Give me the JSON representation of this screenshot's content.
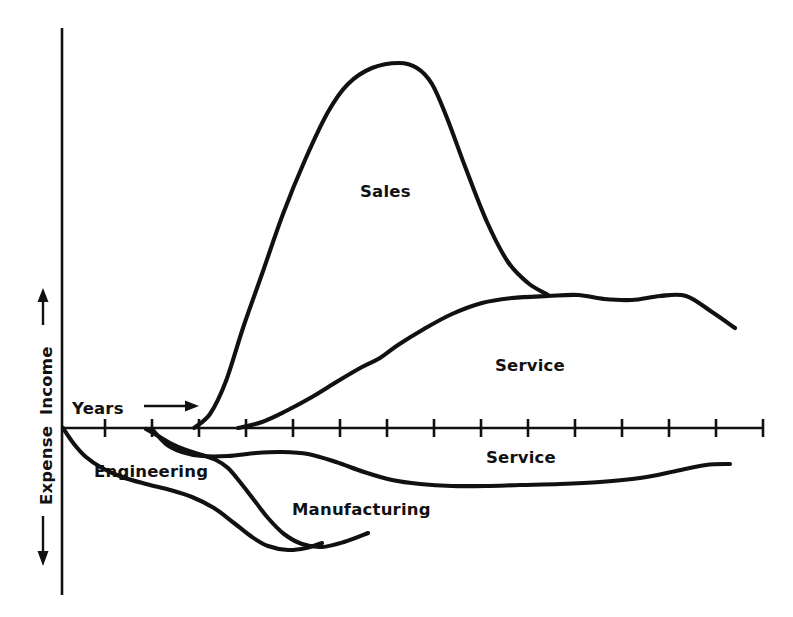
{
  "figure": {
    "background_color": "#ffffff",
    "ink_color": "#111111",
    "width": 793,
    "height": 617
  },
  "axes": {
    "y_axis_name": "income-expense-axis",
    "x_axis_name": "years-axis",
    "origin_px": {
      "x": 62,
      "y": 428
    },
    "x_axis_end_px": {
      "x": 763,
      "y": 428
    },
    "y_axis_top_px": {
      "x": 62,
      "y": 28
    },
    "y_axis_bottom_px": {
      "x": 62,
      "y": 595
    },
    "tick_count": 15,
    "tick_spacing_px": 47,
    "tick_first_px": 105,
    "tick_half_length_px": 9
  },
  "labels": {
    "income": "Income",
    "expense": "Expense",
    "years": "Years",
    "sales": "Sales",
    "service_upper": "Service",
    "service_lower": "Service",
    "engineering": "Engineering",
    "manufacturing": "Manufacturing"
  },
  "chart_data": {
    "type": "area",
    "title": "",
    "subtitle": "",
    "xlabel": "Years",
    "ylabel": "Income / Expense",
    "grid": false,
    "legend": "inline-labels",
    "axis_direction_arrows": {
      "income": "up",
      "expense": "down",
      "years": "right"
    },
    "xlim": [
      0,
      15
    ],
    "ylim": [
      -4.2,
      9.4
    ],
    "x_tick_labels": [],
    "y_tick_labels": [],
    "series": [
      {
        "name": "Sales",
        "region": "income",
        "label_position_px": {
          "x": 360,
          "y": 197
        },
        "x": [
          2.8,
          3.4,
          4.0,
          4.6,
          5.2,
          5.8,
          6.4,
          7.0,
          7.4,
          7.8,
          8.3,
          8.8,
          9.3,
          9.8,
          10.3
        ],
        "y": [
          0.0,
          0.55,
          1.7,
          3.5,
          5.6,
          7.3,
          8.35,
          8.75,
          8.8,
          8.55,
          7.4,
          5.3,
          3.6,
          2.9,
          2.82
        ],
        "points_px": [
          [
            194,
            428
          ],
          [
            210,
            414
          ],
          [
            226,
            381
          ],
          [
            243,
            328
          ],
          [
            262,
            274
          ],
          [
            283,
            214
          ],
          [
            305,
            160
          ],
          [
            328,
            112
          ],
          [
            348,
            84
          ],
          [
            372,
            68
          ],
          [
            399,
            63
          ],
          [
            417,
            68
          ],
          [
            432,
            84
          ],
          [
            447,
            118
          ],
          [
            466,
            169
          ],
          [
            487,
            222
          ],
          [
            508,
            262
          ],
          [
            528,
            283
          ],
          [
            548,
            295
          ]
        ]
      },
      {
        "name": "Service",
        "region": "income",
        "label_position_px": {
          "x": 495,
          "y": 371
        },
        "x": [
          3.8,
          4.6,
          5.4,
          6.2,
          7.0,
          7.8,
          8.6,
          9.4,
          10.2,
          11.0,
          11.8,
          12.6,
          13.4,
          14.2,
          14.9
        ],
        "y": [
          0.0,
          0.45,
          1.0,
          1.6,
          2.25,
          2.8,
          3.3,
          3.6,
          3.72,
          3.75,
          3.68,
          3.6,
          3.55,
          3.3,
          2.95
        ],
        "points_px": [
          [
            238,
            428
          ],
          [
            262,
            422
          ],
          [
            286,
            411
          ],
          [
            312,
            397
          ],
          [
            338,
            381
          ],
          [
            362,
            367
          ],
          [
            380,
            358
          ],
          [
            398,
            345
          ],
          [
            424,
            329
          ],
          [
            452,
            314
          ],
          [
            482,
            303
          ],
          [
            512,
            298
          ],
          [
            548,
            296
          ],
          [
            578,
            295
          ],
          [
            604,
            299
          ],
          [
            632,
            300
          ],
          [
            660,
            296
          ],
          [
            686,
            296
          ],
          [
            712,
            312
          ],
          [
            735,
            328
          ]
        ]
      },
      {
        "name": "Engineering",
        "region": "expense",
        "label_position_px": {
          "x": 94,
          "y": 477
        },
        "x": [
          0.0,
          0.6,
          1.2,
          1.8,
          2.4,
          3.0,
          3.6,
          4.2,
          4.8,
          5.4,
          6.0,
          6.6,
          7.0
        ],
        "y": [
          0.0,
          -0.6,
          -1.0,
          -1.25,
          -1.45,
          -1.65,
          -1.9,
          -2.3,
          -2.75,
          -3.1,
          -3.25,
          -3.15,
          -2.95
        ],
        "points_px": [
          [
            63,
            428
          ],
          [
            74,
            444
          ],
          [
            86,
            457
          ],
          [
            102,
            468
          ],
          [
            122,
            477
          ],
          [
            146,
            484
          ],
          [
            170,
            490
          ],
          [
            192,
            497
          ],
          [
            214,
            508
          ],
          [
            234,
            523
          ],
          [
            252,
            537
          ],
          [
            268,
            546
          ],
          [
            288,
            550
          ],
          [
            306,
            548
          ],
          [
            322,
            543
          ]
        ]
      },
      {
        "name": "Manufacturing",
        "region": "expense",
        "label_position_px": {
          "x": 292,
          "y": 515
        },
        "x": [
          1.0,
          1.6,
          2.2,
          2.8,
          3.4,
          4.0,
          4.6,
          5.2,
          5.8,
          6.4,
          7.0
        ],
        "y": [
          0.0,
          -0.35,
          -0.55,
          -0.85,
          -1.4,
          -2.0,
          -2.5,
          -2.85,
          -3.0,
          -2.9,
          -2.7
        ],
        "points_px": [
          [
            146,
            429
          ],
          [
            160,
            437
          ],
          [
            172,
            444
          ],
          [
            186,
            450
          ],
          [
            202,
            455
          ],
          [
            216,
            460
          ],
          [
            228,
            468
          ],
          [
            240,
            482
          ],
          [
            254,
            500
          ],
          [
            268,
            518
          ],
          [
            284,
            534
          ],
          [
            302,
            544
          ],
          [
            322,
            547
          ],
          [
            344,
            542
          ],
          [
            368,
            533
          ]
        ]
      },
      {
        "name": "Service",
        "region": "expense",
        "label_position_px": {
          "x": 486,
          "y": 463
        },
        "x": [
          1.2,
          2.0,
          2.8,
          3.6,
          4.4,
          5.2,
          6.0,
          7.0,
          8.0,
          9.0,
          10.0,
          11.0,
          12.0,
          13.0,
          14.0,
          14.6
        ],
        "y": [
          0.0,
          -0.45,
          -0.62,
          -0.7,
          -0.8,
          -0.95,
          -1.15,
          -1.4,
          -1.6,
          -1.62,
          -1.6,
          -1.55,
          -1.45,
          -1.25,
          -1.0,
          -0.9
        ],
        "points_px": [
          [
            152,
            429
          ],
          [
            166,
            444
          ],
          [
            182,
            452
          ],
          [
            202,
            456
          ],
          [
            228,
            456
          ],
          [
            256,
            453
          ],
          [
            282,
            452
          ],
          [
            308,
            454
          ],
          [
            336,
            462
          ],
          [
            364,
            472
          ],
          [
            392,
            480
          ],
          [
            420,
            484
          ],
          [
            452,
            486
          ],
          [
            486,
            486
          ],
          [
            520,
            485
          ],
          [
            560,
            484
          ],
          [
            600,
            482
          ],
          [
            640,
            478
          ],
          [
            676,
            471
          ],
          [
            706,
            465
          ],
          [
            730,
            464
          ]
        ]
      }
    ]
  }
}
